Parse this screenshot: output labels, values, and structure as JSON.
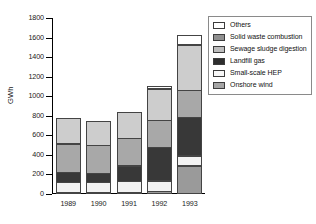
{
  "chart_data": {
    "type": "bar",
    "stacked": true,
    "title": "",
    "subtitle": "",
    "xlabel": "",
    "ylabel": "GWh",
    "categories": [
      "1989",
      "1990",
      "1991",
      "1992",
      "1993"
    ],
    "ylim": [
      0,
      1800
    ],
    "yticks": [
      0,
      200,
      400,
      600,
      800,
      1000,
      1200,
      1400,
      1600,
      1800
    ],
    "ytick_labels": [
      "0",
      "200",
      "400",
      "600",
      "800",
      "1000",
      "1200",
      "1400",
      "1600",
      "1800"
    ],
    "grid": false,
    "legend_position": "right",
    "series": [
      {
        "name": "Onshore wind",
        "color": "#9a9a9a",
        "values": [
          10,
          10,
          12,
          30,
          290
        ]
      },
      {
        "name": "Small-scale HEP",
        "color": "#f2f2f2",
        "values": [
          110,
          105,
          115,
          115,
          110
        ]
      },
      {
        "name": "Landfill gas",
        "color": "#383838",
        "values": [
          105,
          105,
          170,
          350,
          400
        ]
      },
      {
        "name": "Sewage sludge digestion",
        "color": "#a8a8a8",
        "values": [
          300,
          290,
          290,
          280,
          280
        ]
      },
      {
        "name": "Solid waste combustion",
        "color": "#cdcdcd",
        "values": [
          270,
          250,
          273,
          330,
          475
        ]
      },
      {
        "name": "Others",
        "color": "#ffffff",
        "values": [
          0,
          0,
          0,
          40,
          105
        ]
      }
    ],
    "totals": [
      795,
      760,
      860,
      1145,
      1660
    ]
  },
  "legend": {
    "items": [
      {
        "label": "Others",
        "color": "#ffffff"
      },
      {
        "label": "Solid waste combustion",
        "color": "#8f8f8f"
      },
      {
        "label": "Sewage sludge digestion",
        "color": "#bdbdbd"
      },
      {
        "label": "Landfill gas",
        "color": "#2e2e2e"
      },
      {
        "label": "Small-scale HEP",
        "color": "#f7f7f7"
      },
      {
        "label": "Onshore wind",
        "color": "#a5a5a5"
      }
    ]
  }
}
